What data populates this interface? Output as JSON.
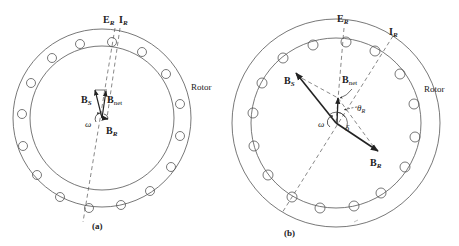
{
  "figure": {
    "panel_a": {
      "caption": "(a)",
      "rotor_label": "Rotor",
      "vectors": {
        "E_R": {
          "main": "E",
          "sub": "R"
        },
        "I_R": {
          "main": "I",
          "sub": "R"
        },
        "B_S": {
          "main": "B",
          "sub": "S"
        },
        "B_net": {
          "main": "B",
          "sub": "net"
        },
        "B_R": {
          "main": "B",
          "sub": "R"
        },
        "omega": "ω"
      }
    },
    "panel_b": {
      "caption": "(b)",
      "rotor_label": "Rotor",
      "vectors": {
        "E_R": {
          "main": "E",
          "sub": "R"
        },
        "I_R": {
          "main": "I",
          "sub": "R"
        },
        "B_S": {
          "main": "B",
          "sub": "S"
        },
        "B_net": {
          "main": "B",
          "sub": "net"
        },
        "B_R": {
          "main": "B",
          "sub": "R"
        },
        "omega": "ω",
        "theta_R": {
          "main": "θ",
          "sub": "R"
        },
        "delta": "δ"
      }
    },
    "colors": {
      "line": "#555555",
      "vector": "#222222",
      "background": "#ffffff"
    }
  }
}
